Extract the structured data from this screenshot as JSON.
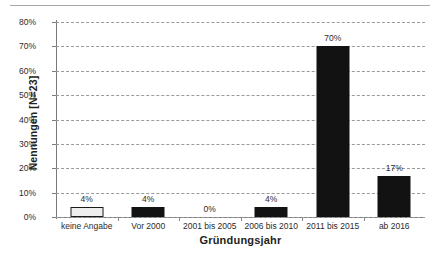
{
  "decorations": {
    "top_rule": "horizontal-rule"
  },
  "chart_data": {
    "type": "bar",
    "title": "",
    "xlabel": "Gründungsjahr",
    "ylabel": "Nennungen [N=23]",
    "categories": [
      "keine Angabe",
      "Vor 2000",
      "2001 bis 2005",
      "2006 bis 2010",
      "2011 bis 2015",
      "ab 2016"
    ],
    "values": [
      4,
      4,
      0,
      4,
      70,
      17
    ],
    "value_labels": [
      "4%",
      "4%",
      "0%",
      "4%",
      "70%",
      "17%"
    ],
    "ylim": [
      0,
      80
    ],
    "ytick_labels": [
      "0%",
      "10%",
      "20%",
      "30%",
      "40%",
      "50%",
      "60%",
      "70%",
      "80%"
    ],
    "ytick_values": [
      0,
      10,
      20,
      30,
      40,
      50,
      60,
      70,
      80
    ],
    "grid": "horizontal-dashed",
    "legend": "none",
    "bar_styles": [
      "hollow",
      "filled",
      "filled",
      "filled",
      "filled",
      "filled"
    ],
    "colors": {
      "bar_fill": "#121212",
      "bar_hollow_fill": "#eeeeee",
      "bar_border": "#1a1a1a",
      "gridline": "#9a9a9a",
      "axis": "#7a7a7a",
      "text": "#2b2b2b",
      "background": "#ffffff"
    }
  }
}
